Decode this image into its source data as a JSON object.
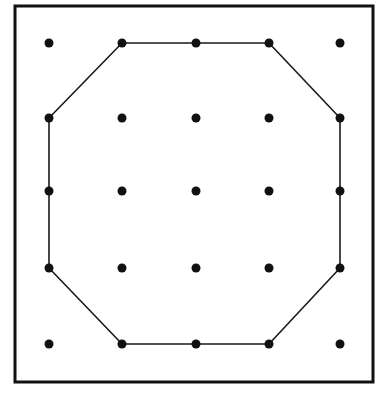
{
  "diagram": {
    "frame": {
      "x": 15,
      "y": 6,
      "width": 358,
      "height": 376
    },
    "grid": {
      "columns_x": [
        49,
        122,
        196,
        269,
        340
      ],
      "rows_y": [
        43,
        118,
        191,
        268,
        344
      ],
      "dot_radius": 4.5
    },
    "polygon": {
      "description": "Octagon drawn through outer-ring dots (corners skipped)",
      "vertices": [
        [
          1,
          0
        ],
        [
          2,
          0
        ],
        [
          3,
          0
        ],
        [
          4,
          1
        ],
        [
          4,
          2
        ],
        [
          4,
          3
        ],
        [
          3,
          4
        ],
        [
          2,
          4
        ],
        [
          1,
          4
        ],
        [
          0,
          3
        ],
        [
          0,
          2
        ],
        [
          0,
          1
        ]
      ],
      "stroke": "#1a1a1a"
    },
    "colors": {
      "ink": "#111111",
      "background": "#ffffff"
    }
  }
}
